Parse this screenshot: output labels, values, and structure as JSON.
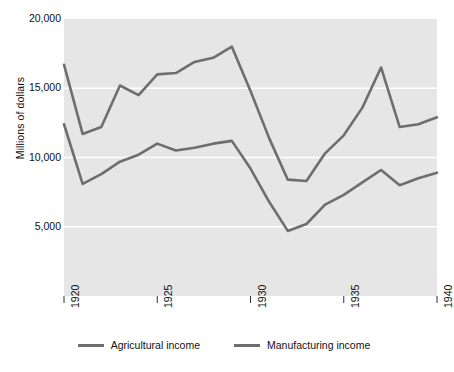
{
  "chart_data": {
    "type": "line",
    "title": "",
    "xlabel": "",
    "ylabel": "Millions of dollars",
    "xlim": [
      1920,
      1940
    ],
    "ylim": [
      0,
      20000
    ],
    "grid": true,
    "gridlines_y": [
      5000,
      10000,
      15000,
      20000
    ],
    "legend_position": "bottom",
    "plot_background": "#e6e6e6",
    "line_color": "#6e6e6e",
    "x": [
      1920,
      1921,
      1922,
      1923,
      1924,
      1925,
      1926,
      1927,
      1928,
      1929,
      1930,
      1931,
      1932,
      1933,
      1934,
      1935,
      1936,
      1937,
      1938,
      1939,
      1940
    ],
    "series": [
      {
        "name": "Agricultural income",
        "color": "#6e6e6e",
        "values": [
          16700,
          11700,
          12200,
          15200,
          14500,
          16000,
          16100,
          16900,
          17200,
          18000,
          14800,
          11400,
          8400,
          8300,
          10300,
          11600,
          13600,
          16500,
          12200,
          12400,
          12900
        ]
      },
      {
        "name": "Manufacturing income",
        "color": "#6e6e6e",
        "values": [
          12400,
          8100,
          8800,
          9700,
          10200,
          11000,
          10500,
          10700,
          11000,
          11200,
          9200,
          6800,
          4700,
          5200,
          6600,
          7300,
          8200,
          9100,
          8000,
          8500,
          8900
        ]
      }
    ],
    "ytick_labels": [
      "20,000",
      "15,000",
      "10,000",
      "5,000"
    ],
    "ytick_values": [
      20000,
      15000,
      10000,
      5000
    ],
    "xtick_labels": [
      "1920",
      "1925",
      "1930",
      "1935",
      "1940"
    ],
    "xtick_values": [
      1920,
      1925,
      1930,
      1935,
      1940
    ]
  }
}
